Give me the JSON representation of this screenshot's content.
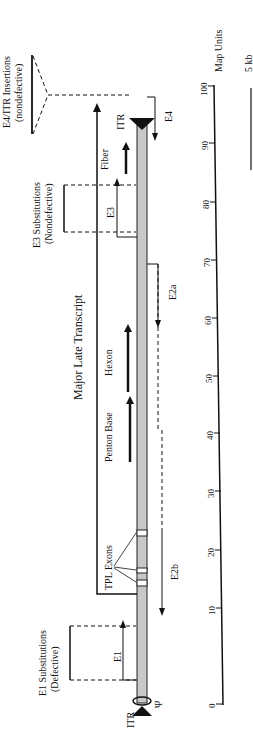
{
  "figure": {
    "orientation": "rotated-90-ccw",
    "genome": {
      "itr_left_label": "ITR",
      "itr_right_label": "ITR",
      "packaging_label": "Ψ",
      "bar_color": "#c8c8c8"
    },
    "insertions": {
      "e1": {
        "title": "E1 Substitutions",
        "subtitle": "(Defective)"
      },
      "e3": {
        "title": "E3 Substitutions",
        "subtitle": "(Nondefective)"
      },
      "e4": {
        "title": "E4/ITR Insertions",
        "subtitle": "(nondefective)"
      }
    },
    "transcripts": {
      "major_late": "Major Late Transcript",
      "tpl_exons": "TPL Exons",
      "penton_base": "Penton Base",
      "hexon": "Hexon",
      "fiber": "Fiber",
      "e1": "E1",
      "e2a": "E2a",
      "e2b": "E2b",
      "e3": "E3",
      "e4": "E4"
    },
    "axis": {
      "label": "Map Units",
      "ticks": [
        "0",
        "10",
        "20",
        "30",
        "40",
        "50",
        "60",
        "70",
        "80",
        "90",
        "100"
      ],
      "scale_bar_label": "5 kb"
    }
  }
}
